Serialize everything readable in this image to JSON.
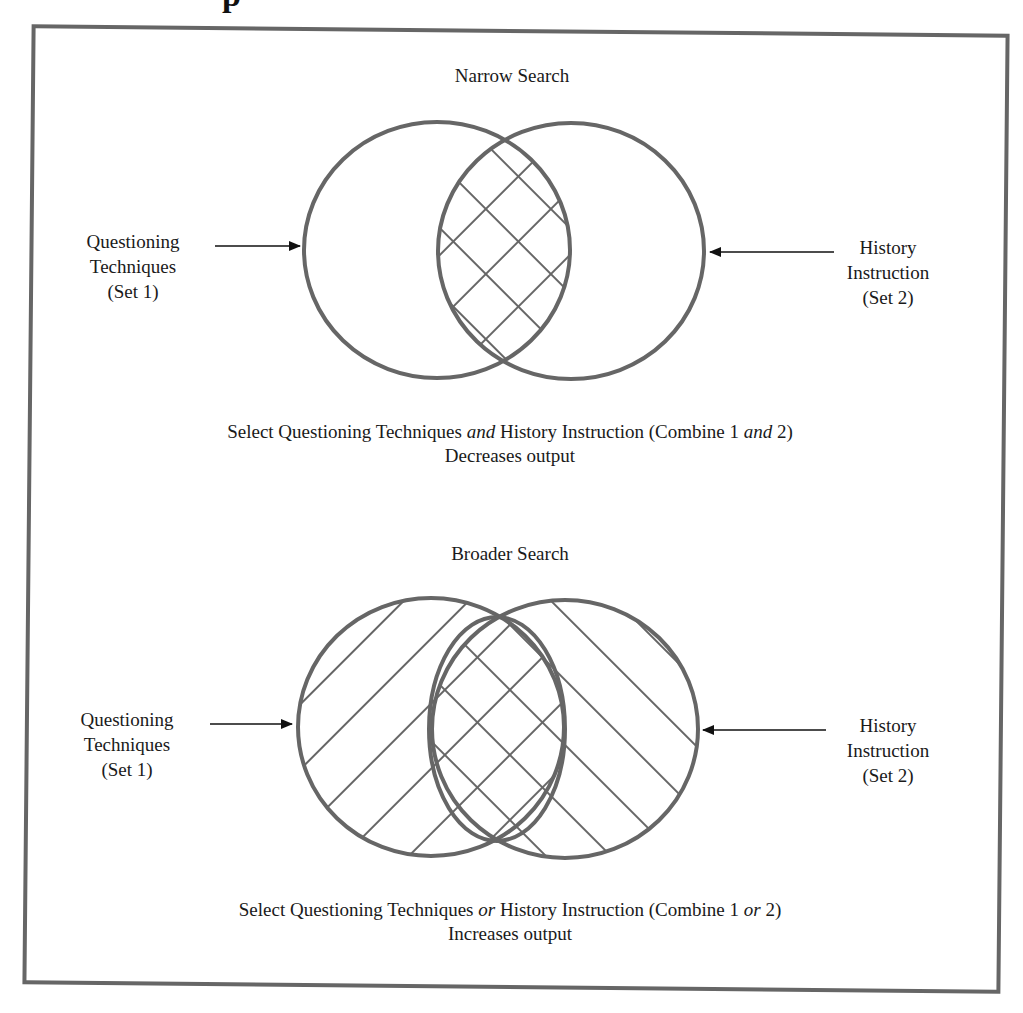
{
  "page": {
    "heading_fragment": "p"
  },
  "diagrams": [
    {
      "id": "narrow",
      "title": "Narrow Search",
      "left_label": {
        "line1": "Questioning",
        "line2": "Techniques",
        "line3": "(Set 1)"
      },
      "right_label": {
        "line1": "History",
        "line2": "Instruction",
        "line3": "(Set 2)"
      },
      "caption": {
        "part1": "Select Questioning Techniques ",
        "operator1": "and",
        "part2": "  History Instruction (Combine 1 ",
        "operator2": "and",
        "part3": " 2)",
        "line2": "Decreases output"
      },
      "shading": "intersection crosshatched (AND)"
    },
    {
      "id": "broader",
      "title": "Broader Search",
      "left_label": {
        "line1": "Questioning",
        "line2": "Techniques",
        "line3": "(Set 1)"
      },
      "right_label": {
        "line1": "History",
        "line2": "Instruction",
        "line3": "(Set 2)"
      },
      "caption": {
        "part1": "Select Questioning Techniques ",
        "operator1": "or",
        "part2": " History Instruction (Combine 1 ",
        "operator2": "or",
        "part3": " 2)",
        "line2": "Increases output"
      },
      "shading": "both sets hatched, overlap crosshatched (OR)"
    }
  ],
  "colors": {
    "stroke": "#666666",
    "arrow": "#111111",
    "text": "#1a1a1a",
    "background": "#ffffff"
  }
}
